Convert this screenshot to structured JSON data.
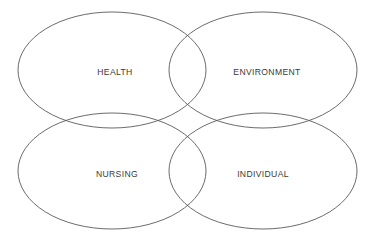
{
  "diagram": {
    "type": "venn-2x2-overlapping-ellipses",
    "title": "",
    "background_color": "#ffffff",
    "stroke_color": "#5a5a5a",
    "label_color": "#3a3a3a",
    "sets": [
      {
        "id": "health",
        "label": "HEALTH",
        "position": "top-left",
        "center_x": 112,
        "center_y": 70,
        "radius_x": 94,
        "radius_y": 58
      },
      {
        "id": "environment",
        "label": "ENVIRONMENT",
        "position": "top-right",
        "center_x": 263,
        "center_y": 70,
        "radius_x": 94,
        "radius_y": 58
      },
      {
        "id": "nursing",
        "label": "NURSING",
        "position": "bottom-left",
        "center_x": 112,
        "center_y": 171,
        "radius_x": 94,
        "radius_y": 58
      },
      {
        "id": "individual",
        "label": "INDIVIDUAL",
        "position": "bottom-right",
        "center_x": 263,
        "center_y": 171,
        "radius_x": 94,
        "radius_y": 58
      }
    ]
  }
}
